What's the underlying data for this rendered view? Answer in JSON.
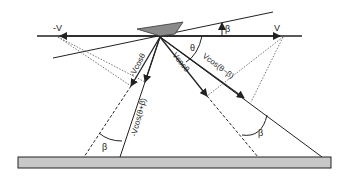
{
  "diagram": {
    "labels": {
      "neg_v": "-V",
      "v": "V",
      "beta_top": "β",
      "theta": "θ",
      "v_cos_theta": "Vcosθ",
      "neg_v_cos_theta": "-Vcosθ",
      "v_cos_theta_minus_beta": "Vcos(θ−β)",
      "neg_v_cos_theta_plus_beta": "-Vcos(θ+β)",
      "beta_left": "β",
      "beta_right": "β"
    },
    "colors": {
      "line": "#222222",
      "ground_fill": "#c8c8c8",
      "platform_fill": "#8a8a8a",
      "dotted": "#555555"
    }
  }
}
